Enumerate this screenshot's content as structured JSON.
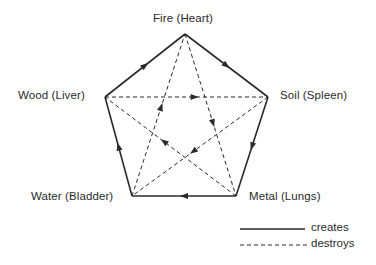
{
  "diagram": {
    "nodes": [
      {
        "id": "fire",
        "label": "Fire (Heart)",
        "x": 185,
        "y": 34,
        "label_x": 153,
        "label_y": 12,
        "label_align": "left"
      },
      {
        "id": "soil",
        "label": "Soil (Spleen)",
        "x": 268,
        "y": 97,
        "label_x": 280,
        "label_y": 89,
        "label_align": "left"
      },
      {
        "id": "metal",
        "label": "Metal (Lungs)",
        "x": 236,
        "y": 196,
        "label_x": 249,
        "label_y": 190,
        "label_align": "left"
      },
      {
        "id": "water",
        "label": "Water (Bladder)",
        "x": 132,
        "y": 196,
        "label_x": 31,
        "label_y": 190,
        "label_align": "left"
      },
      {
        "id": "wood",
        "label": "Wood (Liver)",
        "x": 105,
        "y": 97,
        "label_x": 18,
        "label_y": 89,
        "label_align": "left"
      }
    ],
    "creates_edges": [
      {
        "from": "wood",
        "to": "fire"
      },
      {
        "from": "fire",
        "to": "soil"
      },
      {
        "from": "soil",
        "to": "metal"
      },
      {
        "from": "metal",
        "to": "water"
      },
      {
        "from": "water",
        "to": "wood"
      }
    ],
    "destroys_edges": [
      {
        "from": "wood",
        "to": "soil"
      },
      {
        "from": "soil",
        "to": "water"
      },
      {
        "from": "water",
        "to": "fire"
      },
      {
        "from": "fire",
        "to": "metal"
      },
      {
        "from": "metal",
        "to": "wood"
      }
    ],
    "colors": {
      "line": "#2a2a2a",
      "background": "#ffffff"
    }
  },
  "legend": {
    "creates_label": "creates",
    "destroys_label": "destroys"
  }
}
